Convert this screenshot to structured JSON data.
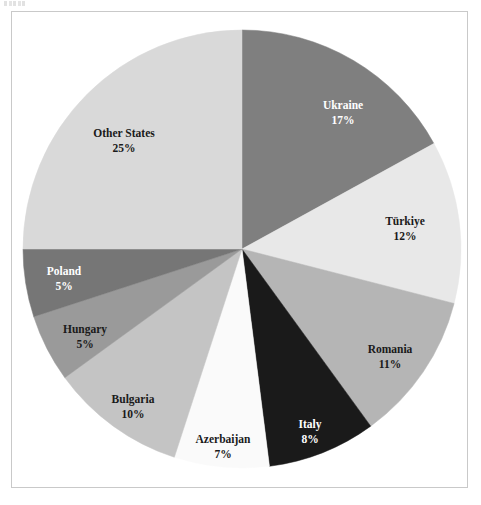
{
  "figure": {
    "background_color": "#ffffff",
    "frame_color": "#c9c9c9",
    "label_dark_color": "#1a1a1a",
    "label_light_color": "#ffffff",
    "artifact_name": "scan-artifact"
  },
  "chart_data": {
    "type": "pie",
    "title": "",
    "subtitle": "",
    "xlabel": "",
    "ylabel": "",
    "legend": "none",
    "grid": false,
    "start_angle_deg": 0,
    "direction": "clockwise",
    "units": "percent",
    "total": 100,
    "categories": [
      "Ukraine",
      "Türkiye",
      "Romania",
      "Italy",
      "Azerbaijan",
      "Bulgaria",
      "Hungary",
      "Poland",
      "Other States"
    ],
    "values": [
      17,
      12,
      11,
      8,
      7,
      10,
      5,
      5,
      25
    ],
    "value_labels": [
      "17%",
      "12%",
      "11%",
      "8%",
      "7%",
      "10%",
      "5%",
      "5%",
      "25%"
    ],
    "colors": [
      "#7f7f7f",
      "#e8e8e8",
      "#b5b5b5",
      "#1a1a1a",
      "#fafafa",
      "#c4c4c4",
      "#9a9a9a",
      "#767676",
      "#d9d9d9"
    ],
    "slices": [
      {
        "name": "Ukraine",
        "value": 17,
        "value_label": "17%",
        "color": "#7f7f7f",
        "text_color": "#ffffff",
        "label_x": 343,
        "label_y": 106,
        "value_x": 343,
        "value_y": 121
      },
      {
        "name": "Türkiye",
        "value": 12,
        "value_label": "12%",
        "color": "#e8e8e8",
        "text_color": "#1a1a1a",
        "label_x": 405,
        "label_y": 222,
        "value_x": 405,
        "value_y": 237
      },
      {
        "name": "Romania",
        "value": 11,
        "value_label": "11%",
        "color": "#b5b5b5",
        "text_color": "#1a1a1a",
        "label_x": 390,
        "label_y": 350,
        "value_x": 390,
        "value_y": 365
      },
      {
        "name": "Italy",
        "value": 8,
        "value_label": "8%",
        "color": "#1a1a1a",
        "text_color": "#ffffff",
        "label_x": 310,
        "label_y": 425,
        "value_x": 310,
        "value_y": 440
      },
      {
        "name": "Azerbaijan",
        "value": 7,
        "value_label": "7%",
        "color": "#fafafa",
        "text_color": "#1a1a1a",
        "label_x": 223,
        "label_y": 440,
        "value_x": 223,
        "value_y": 455
      },
      {
        "name": "Bulgaria",
        "value": 10,
        "value_label": "10%",
        "color": "#c4c4c4",
        "text_color": "#1a1a1a",
        "label_x": 133,
        "label_y": 400,
        "value_x": 133,
        "value_y": 415
      },
      {
        "name": "Hungary",
        "value": 5,
        "value_label": "5%",
        "color": "#9a9a9a",
        "text_color": "#1a1a1a",
        "label_x": 85,
        "label_y": 330,
        "value_x": 85,
        "value_y": 345
      },
      {
        "name": "Poland",
        "value": 5,
        "value_label": "5%",
        "color": "#767676",
        "text_color": "#ffffff",
        "label_x": 64,
        "label_y": 272,
        "value_x": 64,
        "value_y": 287
      },
      {
        "name": "Other States",
        "value": 25,
        "value_label": "25%",
        "color": "#d9d9d9",
        "text_color": "#1a1a1a",
        "label_x": 124,
        "label_y": 134,
        "value_x": 124,
        "value_y": 149
      }
    ],
    "geometry": {
      "center_x": 242,
      "center_y": 249,
      "radius": 219
    }
  }
}
